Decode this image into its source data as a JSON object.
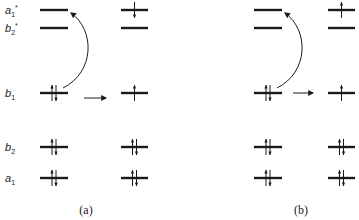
{
  "levels": [
    {
      "id": "a1_star",
      "label": "a",
      "sub": "1",
      "sup": "*",
      "y": 10
    },
    {
      "id": "b2_star",
      "label": "b",
      "sub": "2",
      "sup": "*",
      "y": 28
    },
    {
      "id": "b1",
      "label": "b",
      "sub": "1",
      "sup": "",
      "y": 93
    },
    {
      "id": "b2",
      "label": "b",
      "sub": "2",
      "sup": "",
      "y": 147
    },
    {
      "id": "a1",
      "label": "a",
      "sub": "1",
      "sup": "",
      "y": 178
    }
  ],
  "panels": [
    {
      "caption": "(a)",
      "caption_x": 86,
      "left_x": [
        40,
        68
      ],
      "right_x": [
        121,
        148
      ],
      "left_occupancy": {
        "a1_star": "empty",
        "b2_star": "empty",
        "b1": "paired",
        "b2": "paired",
        "a1": "paired"
      },
      "right_occupancy": {
        "a1_star": "down",
        "b2_star": "empty",
        "b1": "up",
        "b2": "paired",
        "a1": "paired"
      }
    },
    {
      "caption": "(b)",
      "caption_x": 301,
      "left_x": [
        254,
        282
      ],
      "right_x": [
        328,
        355
      ],
      "left_occupancy": {
        "a1_star": "empty",
        "b2_star": "empty",
        "b1": "paired",
        "b2": "paired",
        "a1": "paired"
      },
      "right_occupancy": {
        "a1_star": "up",
        "b2_star": "empty",
        "b1": "up",
        "b2": "paired",
        "a1": "paired"
      }
    }
  ],
  "colors": {
    "ink": "#1a1a1a",
    "background": "#ffffff"
  }
}
